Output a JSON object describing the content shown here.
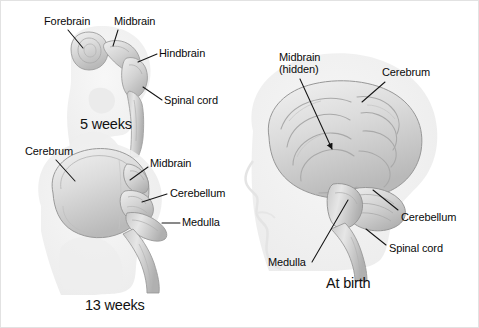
{
  "figure": {
    "background_color": "#ffffff",
    "border_color": "#e2e2e2",
    "label_color": "#0a0a0a",
    "leader_line_color": "#1a1a1a",
    "brain_fill_color": "#d9d9d9",
    "brain_outline_color": "#9a9a9a",
    "head_silhouette_color": "#efefef"
  },
  "panels": [
    {
      "id": "five-weeks",
      "caption": "5 weeks",
      "labels": [
        {
          "id": "forebrain",
          "text": "Forebrain"
        },
        {
          "id": "midbrain",
          "text": "Midbrain"
        },
        {
          "id": "hindbrain",
          "text": "Hindbrain"
        },
        {
          "id": "spinal-cord",
          "text": "Spinal cord"
        }
      ]
    },
    {
      "id": "thirteen-weeks",
      "caption": "13 weeks",
      "labels": [
        {
          "id": "cerebrum",
          "text": "Cerebrum"
        },
        {
          "id": "midbrain",
          "text": "Midbrain"
        },
        {
          "id": "cerebellum",
          "text": "Cerebellum"
        },
        {
          "id": "medulla",
          "text": "Medulla"
        }
      ]
    },
    {
      "id": "at-birth",
      "caption": "At birth",
      "labels": [
        {
          "id": "midbrain",
          "text": "Midbrain",
          "text_line2": "(hidden)"
        },
        {
          "id": "cerebrum",
          "text": "Cerebrum"
        },
        {
          "id": "cerebellum",
          "text": "Cerebellum"
        },
        {
          "id": "spinal-cord",
          "text": "Spinal cord"
        },
        {
          "id": "medulla",
          "text": "Medulla"
        }
      ]
    }
  ]
}
